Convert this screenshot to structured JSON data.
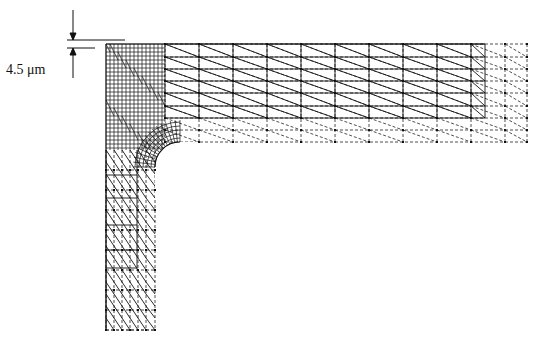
{
  "figure": {
    "type": "finite-element-mesh",
    "colors": {
      "line": "#111111",
      "background": "#ffffff"
    }
  },
  "annotation": {
    "dimension_label": "4.5 μm",
    "arrow_style": "opposing-arrows"
  },
  "geometry": {
    "horizontal_arm": {
      "x0": 106,
      "x1": 527,
      "y0": 44,
      "y1": 142,
      "solid_x1": 485,
      "solid_y1": 118
    },
    "vertical_arm": {
      "x0": 106,
      "x1": 155,
      "y0": 44,
      "y1": 330,
      "solid_y1": 268,
      "solid_x1": 137
    },
    "fillet": {
      "cx": 180,
      "cy": 167,
      "r": 25
    },
    "dimension_arrow_x": 73,
    "dimension_lines_y": [
      40,
      44
    ]
  }
}
